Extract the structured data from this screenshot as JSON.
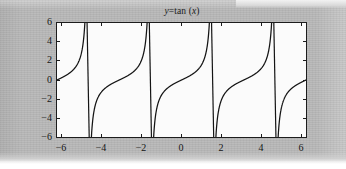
{
  "figure": {
    "title_prefix": "y",
    "title_equals": "=tan (",
    "title_var": "x",
    "title_suffix": ")",
    "title_full": "y=tan (x)",
    "background_color": "#b9b9b9",
    "plot_face_color": "#fbfbfb",
    "axis_color": "#1c1c1c",
    "line_color": "#141414"
  },
  "axes": {
    "y_ticklabels": [
      "6",
      "4",
      "2",
      "0",
      "−2",
      "−4",
      "−6"
    ],
    "x_ticklabels": [
      "−6",
      "−4",
      "−2",
      "0",
      "2",
      "4",
      "6"
    ]
  },
  "chart_data": {
    "type": "line",
    "title": "y=tan (x)",
    "xlabel": "",
    "ylabel": "",
    "xlim": [
      -6.2832,
      6.2832
    ],
    "ylim": [
      -6,
      6
    ],
    "grid": false,
    "legend": null,
    "function": "y = tan(x)",
    "x_ticks": [
      -6,
      -4,
      -2,
      0,
      2,
      4,
      6
    ],
    "y_ticks": [
      -6,
      -4,
      -2,
      0,
      2,
      4,
      6
    ],
    "asymptotes": [
      -4.712389,
      -1.570796,
      1.570796,
      4.712389
    ],
    "series": [
      {
        "name": "tan(x)",
        "color": "#141414",
        "x": [
          -6.2832,
          -6.0,
          -5.8,
          -5.6,
          -5.4,
          -5.2,
          -5.0,
          -4.9,
          -4.8,
          -4.75,
          -4.68,
          -4.6,
          -4.5,
          -4.4,
          -4.2,
          -4.0,
          -3.8,
          -3.6,
          -3.4,
          -3.2,
          -3.0,
          -2.8,
          -2.6,
          -2.4,
          -2.2,
          -2.0,
          -1.8,
          -1.7,
          -1.63,
          -1.6,
          -1.54,
          -1.5,
          -1.4,
          -1.3,
          -1.2,
          -1.0,
          -0.8,
          -0.6,
          -0.4,
          -0.2,
          0.0,
          0.2,
          0.4,
          0.6,
          0.8,
          1.0,
          1.2,
          1.3,
          1.4,
          1.5,
          1.54,
          1.6,
          1.63,
          1.7,
          1.8,
          2.0,
          2.2,
          2.4,
          2.6,
          2.8,
          3.0,
          3.2,
          3.4,
          3.6,
          3.8,
          4.0,
          4.2,
          4.4,
          4.5,
          4.6,
          4.68,
          4.75,
          4.8,
          4.9,
          5.0,
          5.2,
          5.4,
          5.6,
          5.8,
          6.0,
          6.2832
        ],
        "y": [
          0.0,
          0.291,
          0.529,
          0.814,
          1.224,
          1.886,
          3.381,
          5.267,
          11.385,
          22.1,
          -60.0,
          -13.2,
          -7.697,
          -5.404,
          -3.286,
          -2.24,
          -1.6,
          -1.155,
          -0.796,
          -0.479,
          -0.18,
          0.113,
          0.415,
          0.753,
          1.174,
          1.786,
          2.912,
          4.077,
          5.833,
          7.697,
          20.5,
          -40.0,
          -7.696,
          -4.076,
          -2.912,
          -1.786,
          -1.175,
          -0.753,
          -0.415,
          -0.113,
          0.0,
          0.113,
          0.415,
          0.753,
          1.175,
          1.786,
          2.912,
          4.076,
          7.696,
          40.0,
          -20.5,
          -7.697,
          -5.833,
          -4.077,
          -2.912,
          -1.786,
          -1.174,
          -0.753,
          -0.415,
          -0.113,
          0.18,
          0.479,
          0.796,
          1.155,
          1.6,
          2.24,
          3.286,
          5.404,
          7.697,
          13.2,
          60.0,
          -22.1,
          -11.385,
          -5.267,
          -3.381,
          -1.886,
          -1.224,
          -0.814,
          -0.529,
          -0.291,
          0.0
        ]
      }
    ]
  }
}
